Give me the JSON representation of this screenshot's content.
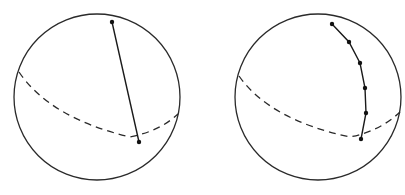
{
  "figure": {
    "panels": [
      {
        "id": "left",
        "description": "Sphere with a straight chord connecting two points",
        "path_type": "straight-segment",
        "point_count": 2
      },
      {
        "id": "right",
        "description": "Sphere with a polyline through intermediate points following the surface",
        "path_type": "geodesic-polyline",
        "point_count": 6
      }
    ],
    "colors": {
      "stroke": "#2a2a2a",
      "point": "#111111",
      "background": "#ffffff"
    }
  }
}
